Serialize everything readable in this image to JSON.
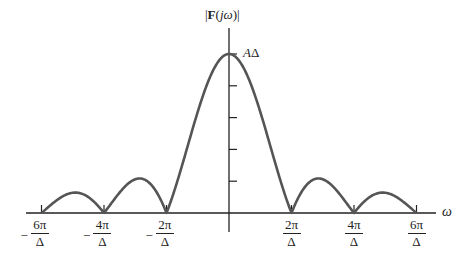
{
  "chart_data": {
    "type": "line",
    "title": "|F(jω)|",
    "ylabel": "|F(jω)|",
    "xlabel": "ω",
    "function": "|F(jω)| = AΔ · |sin(ωΔ/2) / (ωΔ/2)|",
    "peak_label": "AΔ",
    "peak_value": 1.0,
    "x_ticks": [
      {
        "value": -3,
        "label": "−6π/Δ",
        "sign": "−",
        "num": "6π",
        "den": "Δ"
      },
      {
        "value": -2,
        "label": "−4π/Δ",
        "sign": "−",
        "num": "4π",
        "den": "Δ"
      },
      {
        "value": -1,
        "label": "−2π/Δ",
        "sign": "−",
        "num": "2π",
        "den": "Δ"
      },
      {
        "value": 1,
        "label": "2π/Δ",
        "sign": "",
        "num": "2π",
        "den": "Δ"
      },
      {
        "value": 2,
        "label": "4π/Δ",
        "sign": "",
        "num": "4π",
        "den": "Δ"
      },
      {
        "value": 3,
        "label": "6π/Δ",
        "sign": "",
        "num": "6π",
        "den": "Δ"
      }
    ],
    "x_unit": "2π/Δ",
    "xlim": [
      -3.3,
      3.3
    ],
    "ylim": [
      0,
      1.1
    ],
    "y_tick_count": 5,
    "zero_crossings": [
      -3,
      -2,
      -1,
      1,
      2,
      3
    ],
    "side_lobe_peaks": [
      {
        "x": -2.46,
        "y": 0.128
      },
      {
        "x": -1.43,
        "y": 0.217
      },
      {
        "x": 1.43,
        "y": 0.217
      },
      {
        "x": 2.46,
        "y": 0.128
      }
    ],
    "grid": false,
    "legend": null
  },
  "labels": {
    "title_bar_left": "|",
    "title_bold": "F",
    "title_paren": "(",
    "title_italic": "jω",
    "title_close": ")|",
    "peak_A": "A",
    "peak_delta": "Δ",
    "omega": "ω"
  },
  "style": {
    "curve_color": "#555555",
    "axis_color": "#222222"
  }
}
